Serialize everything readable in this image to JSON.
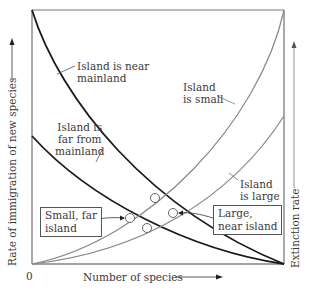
{
  "diagram": {
    "axes": {
      "x_label": "Number of species",
      "x_origin": "0",
      "left_y_label": "Rate of immigration of new species",
      "right_y_label": "Extinction rate"
    },
    "curves": [
      {
        "name": "immigration-near",
        "label": "Island is near mainland",
        "kind": "immigration",
        "color": "#1a1a1a"
      },
      {
        "name": "immigration-far",
        "label": "Island is far from mainland",
        "kind": "immigration",
        "color": "#1a1a1a"
      },
      {
        "name": "extinction-small",
        "label": "Island is small",
        "kind": "extinction",
        "color": "#888888"
      },
      {
        "name": "extinction-large",
        "label": "Island is large",
        "kind": "extinction",
        "color": "#888888"
      }
    ],
    "labels": {
      "near_line1": "Island is near",
      "near_line2": "mainland",
      "far_line1": "Island is",
      "far_line2": "far from",
      "far_line3": "mainland",
      "small_line1": "Island",
      "small_line2": "is small",
      "large_line1": "Island",
      "large_line2": "is large"
    },
    "callouts": {
      "small_far_line1": "Small, far",
      "small_far_line2": "island",
      "large_near_line1": "Large,",
      "large_near_line2": "near island"
    },
    "equilibria": [
      {
        "name": "near-small",
        "x": 155,
        "y": 198
      },
      {
        "name": "far-small",
        "x": 130,
        "y": 218
      },
      {
        "name": "far-large",
        "x": 147,
        "y": 228
      },
      {
        "name": "near-large",
        "x": 173,
        "y": 213
      }
    ]
  }
}
